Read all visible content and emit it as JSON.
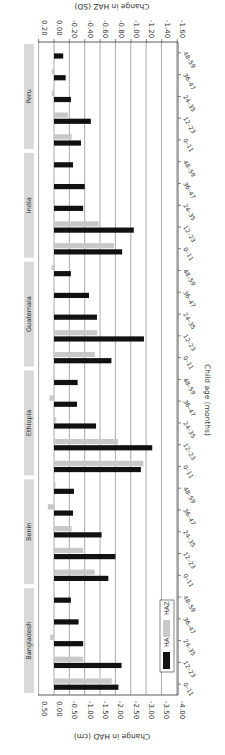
{
  "chart_data": {
    "type": "bar",
    "orientation": "horizontal-rotated-90",
    "title": "",
    "xlabel": "Child age (months)",
    "ylabel_left": "Change in HAD (cm)",
    "ylabel_right": "Change in HAZ (SD)",
    "ylim_had": [
      0.5,
      -4.0
    ],
    "ylim_haz": [
      0.2,
      -1.6
    ],
    "had_ticks": [
      "0.50",
      "0.00",
      "-0.50",
      "-1.00",
      "-1.50",
      "-2.00",
      "-2.50",
      "-3.00",
      "-3.50",
      "-4.00"
    ],
    "haz_ticks": [
      "0.20",
      "0.00",
      "-0.20",
      "-0.40",
      "-0.60",
      "-0.80",
      "-1.00",
      "-1.20",
      "-1.40",
      "-1.60"
    ],
    "grid": true,
    "legend": {
      "position": "inside-bottom",
      "entries": [
        "HAD",
        "HAZ"
      ]
    },
    "colors": {
      "HAD": "#111111",
      "HAZ": "#c8c8c8",
      "panel_label_bg": "#d9d9d9",
      "grid": "#555555"
    },
    "age_groups": [
      "0–11",
      "12–23",
      "24–35",
      "36–47",
      "48–59"
    ],
    "countries": [
      {
        "name": "Bangladesh",
        "HAD": [
          -2.1,
          -2.2,
          -0.95,
          -0.8,
          -0.55
        ],
        "HAZ": [
          -0.75,
          -0.38,
          0.05,
          0.01,
          0.0
        ]
      },
      {
        "name": "Benin",
        "HAD": [
          -1.77,
          -2.0,
          -1.55,
          -0.62,
          -0.65
        ],
        "HAZ": [
          -0.53,
          -0.38,
          -0.23,
          0.08,
          -0.02
        ]
      },
      {
        "name": "Ethiopia",
        "HAD": [
          -2.83,
          -3.2,
          -1.37,
          -0.75,
          -0.77
        ],
        "HAZ": [
          -1.16,
          -0.83,
          -0.03,
          0.06,
          0.0
        ]
      },
      {
        "name": "Guatemala",
        "HAD": [
          -1.87,
          -2.93,
          -1.4,
          -1.14,
          -0.55
        ],
        "HAZ": [
          -0.53,
          -0.56,
          0.0,
          0.0,
          0.03
        ]
      },
      {
        "name": "India",
        "HAD": [
          -2.22,
          -2.6,
          -0.95,
          -1.0,
          -0.62
        ],
        "HAZ": [
          -0.78,
          -0.58,
          0.0,
          0.0,
          0.0
        ]
      },
      {
        "name": "Peru",
        "HAD": [
          -0.88,
          -1.2,
          -0.55,
          -0.38,
          -0.3
        ],
        "HAZ": [
          -0.23,
          -0.18,
          0.03,
          0.03,
          0.0
        ]
      }
    ]
  }
}
